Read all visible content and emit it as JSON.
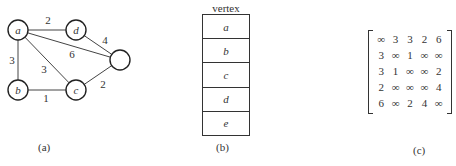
{
  "graph": {
    "nodes": [
      {
        "id": "a",
        "label": "a",
        "x": 18,
        "y": 30
      },
      {
        "id": "d",
        "label": "d",
        "x": 76,
        "y": 30
      },
      {
        "id": "e",
        "label": "",
        "x": 120,
        "y": 60
      },
      {
        "id": "b",
        "label": "b",
        "x": 18,
        "y": 90
      },
      {
        "id": "c",
        "label": "c",
        "x": 76,
        "y": 90
      }
    ],
    "edges": [
      {
        "from": "a",
        "to": "d",
        "weight": "2",
        "lx": 48,
        "ly": 24
      },
      {
        "from": "a",
        "to": "b",
        "weight": "3",
        "lx": 12,
        "ly": 64
      },
      {
        "from": "a",
        "to": "c",
        "weight": "3",
        "lx": 44,
        "ly": 73
      },
      {
        "from": "a",
        "to": "e",
        "weight": "6",
        "lx": 72,
        "ly": 58
      },
      {
        "from": "d",
        "to": "e",
        "weight": "4",
        "lx": 105,
        "ly": 44
      },
      {
        "from": "b",
        "to": "c",
        "weight": "1",
        "lx": 46,
        "ly": 102
      },
      {
        "from": "c",
        "to": "e",
        "weight": "2",
        "lx": 103,
        "ly": 88
      }
    ],
    "caption": "(a)"
  },
  "vertex_table": {
    "title": "vertex",
    "rows": [
      "a",
      "b",
      "c",
      "d",
      "e"
    ],
    "caption": "(b)"
  },
  "matrix": {
    "rows": [
      [
        "∞",
        "3",
        "3",
        "2",
        "6"
      ],
      [
        "3",
        "∞",
        "1",
        "∞",
        "∞"
      ],
      [
        "3",
        "1",
        "∞",
        "∞",
        "2"
      ],
      [
        "2",
        "∞",
        "∞",
        "∞",
        "4"
      ],
      [
        "6",
        "∞",
        "2",
        "4",
        "∞"
      ]
    ],
    "caption": "(c)"
  }
}
